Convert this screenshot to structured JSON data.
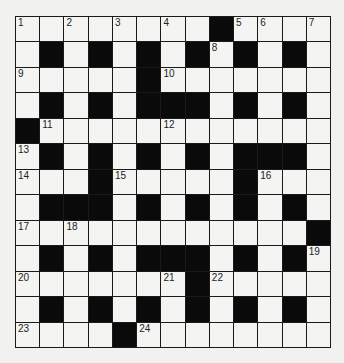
{
  "puzzle": {
    "rows": 13,
    "cols": 13,
    "grid": [
      "........#....",
      ".#.#.#.#.#.#.",
      ".....#.......",
      ".#.#.###.#.#.",
      "#............",
      ".#.#.#.#.###.",
      "...#.....#...",
      ".###.#.#.#.#.",
      "............#",
      ".#.#.###.#.#.",
      ".......#.....",
      ".#.#.#.#.#.#.",
      "....#........"
    ],
    "numbers": [
      {
        "r": 0,
        "c": 0,
        "n": "1"
      },
      {
        "r": 0,
        "c": 2,
        "n": "2"
      },
      {
        "r": 0,
        "c": 4,
        "n": "3"
      },
      {
        "r": 0,
        "c": 6,
        "n": "4"
      },
      {
        "r": 0,
        "c": 9,
        "n": "5"
      },
      {
        "r": 0,
        "c": 10,
        "n": "6"
      },
      {
        "r": 0,
        "c": 12,
        "n": "7"
      },
      {
        "r": 1,
        "c": 8,
        "n": "8"
      },
      {
        "r": 2,
        "c": 0,
        "n": "9"
      },
      {
        "r": 2,
        "c": 6,
        "n": "10"
      },
      {
        "r": 4,
        "c": 1,
        "n": "11"
      },
      {
        "r": 4,
        "c": 6,
        "n": "12"
      },
      {
        "r": 5,
        "c": 0,
        "n": "13"
      },
      {
        "r": 6,
        "c": 0,
        "n": "14"
      },
      {
        "r": 6,
        "c": 4,
        "n": "15"
      },
      {
        "r": 6,
        "c": 10,
        "n": "16"
      },
      {
        "r": 8,
        "c": 0,
        "n": "17"
      },
      {
        "r": 8,
        "c": 2,
        "n": "18"
      },
      {
        "r": 9,
        "c": 12,
        "n": "19"
      },
      {
        "r": 10,
        "c": 0,
        "n": "20"
      },
      {
        "r": 10,
        "c": 6,
        "n": "21"
      },
      {
        "r": 10,
        "c": 8,
        "n": "22"
      },
      {
        "r": 12,
        "c": 0,
        "n": "23"
      },
      {
        "r": 12,
        "c": 5,
        "n": "24"
      }
    ]
  }
}
